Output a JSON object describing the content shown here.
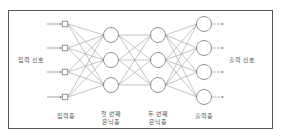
{
  "diagram": {
    "type": "neural-network",
    "colors": {
      "border": "#555555",
      "line": "#888888",
      "node": "#666666",
      "text": "#555555"
    },
    "side_labels": {
      "input_signal": "입력 신호",
      "output_signal": "출력 신호"
    },
    "layers": [
      {
        "id": "input",
        "label": "입력층",
        "shape": "square",
        "x": 65,
        "nodes": [
          24,
          48,
          72,
          97
        ]
      },
      {
        "id": "hidden1",
        "label": "첫 번째\n은닉층",
        "shape": "circle",
        "x": 111,
        "nodes": [
          35,
          60,
          85
        ]
      },
      {
        "id": "hidden2",
        "label": "두 번째\n은닉층",
        "shape": "circle",
        "x": 158,
        "nodes": [
          35,
          60,
          85
        ]
      },
      {
        "id": "output",
        "label": "출력층",
        "shape": "circle",
        "x": 204,
        "nodes": [
          24,
          48,
          72,
          97
        ]
      }
    ]
  }
}
